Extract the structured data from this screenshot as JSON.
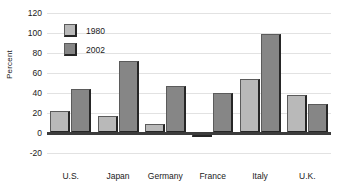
{
  "chart_data": {
    "type": "bar",
    "title": "",
    "xlabel": "",
    "ylabel": "Percent",
    "ylim": [
      -20,
      120
    ],
    "yticks": [
      -20,
      0,
      20,
      40,
      60,
      80,
      100,
      120
    ],
    "ytick_labels": [
      "-20",
      "0",
      "20",
      "40",
      "60",
      "80",
      "100",
      "120"
    ],
    "grid": true,
    "legend_position": "upper-left-inside",
    "categories": [
      "U.S.",
      "Japan",
      "Germany",
      "France",
      "Italy",
      "U.K."
    ],
    "series": [
      {
        "name": "1980",
        "color": "#b9b9b9",
        "values": [
          22,
          17,
          9,
          -4,
          54,
          38
        ]
      },
      {
        "name": "2002",
        "color": "#868686",
        "values": [
          44,
          72,
          47,
          40,
          99,
          29
        ]
      }
    ]
  },
  "colors": {
    "series_1980": "#b9b9b9",
    "series_2002": "#868686",
    "bar_edge": "#5b5b5b",
    "bar_shadow": "#262626",
    "gridline": "#e2e2e2",
    "zero_line": "#3c3c3c",
    "text": "#1a1a1a",
    "background": "#ffffff"
  }
}
